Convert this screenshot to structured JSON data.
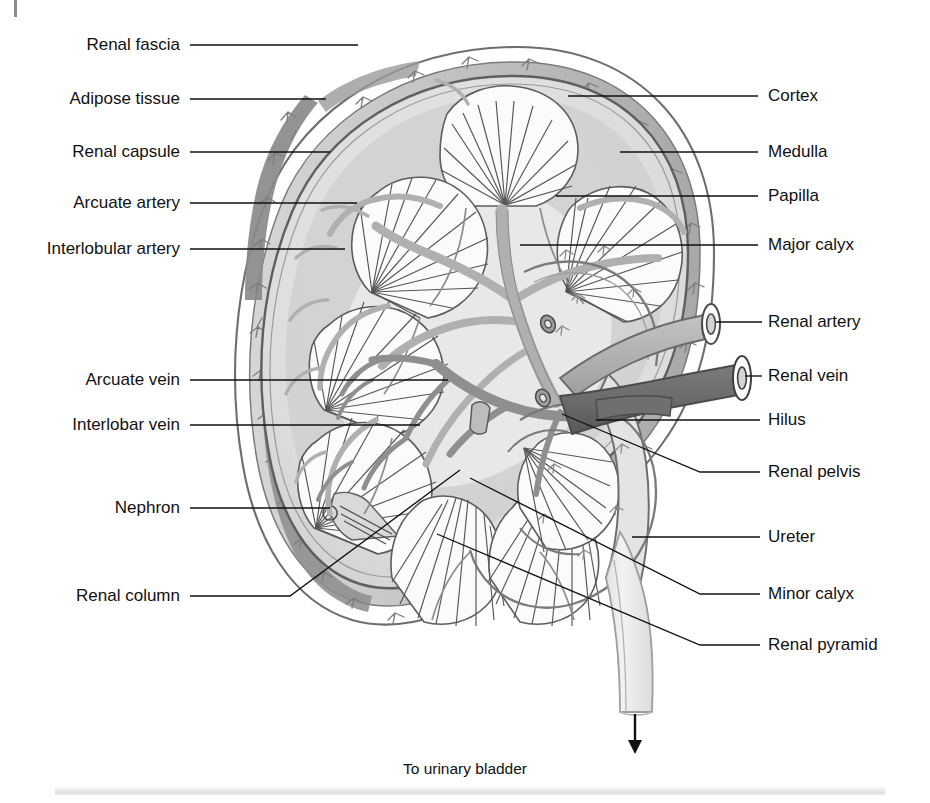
{
  "figure": {
    "caption_below": "To urinary  bladder",
    "arrow_icon": "down-arrow-icon",
    "colors": {
      "ink": "#3f3f3f",
      "line": "#1a1a1a",
      "fascia_fill": "#ffffff",
      "adipose_fill": "#c9c9c9",
      "adipose_dark": "#8e8e8e",
      "capsule_stroke": "#6e6e6e",
      "cortex_fill": "#dedede",
      "medulla_fill": "#cfcfcf",
      "pyramid_fill": "#fbfbfb",
      "pelvis_fill": "#ededed",
      "artery_fill": "#b3b3b3",
      "vein_fill": "#6f6f6f",
      "vein_dark": "#585858",
      "ureter_fill": "#ececec"
    }
  },
  "labels_left": [
    {
      "id": "renal-fascia",
      "text": "Renal fascia",
      "y": 45,
      "text_x": 180,
      "line_x1": 190,
      "line_x2": 358,
      "tip_x": 358,
      "tip_y": 45
    },
    {
      "id": "adipose-tissue",
      "text": "Adipose tissue",
      "y": 99,
      "text_x": 180,
      "line_x1": 190,
      "line_x2": 326,
      "tip_x": 326,
      "tip_y": 99
    },
    {
      "id": "renal-capsule",
      "text": "Renal capsule",
      "y": 152,
      "text_x": 180,
      "line_x1": 190,
      "line_x2": 330,
      "tip_x": 330,
      "tip_y": 152
    },
    {
      "id": "arcuate-artery",
      "text": "Arcuate artery",
      "y": 203,
      "text_x": 180,
      "line_x1": 190,
      "line_x2": 357,
      "tip_x": 357,
      "tip_y": 203
    },
    {
      "id": "interlobular-artery",
      "text": "Interlobular artery",
      "y": 249,
      "text_x": 180,
      "line_x1": 190,
      "line_x2": 345,
      "tip_x": 345,
      "tip_y": 249
    },
    {
      "id": "arcuate-vein",
      "text": "Arcuate vein",
      "y": 380,
      "text_x": 180,
      "line_x1": 190,
      "line_x2": 448,
      "tip_x": 448,
      "tip_y": 380
    },
    {
      "id": "interlobar-vein",
      "text": "Interlobar vein",
      "y": 425,
      "text_x": 180,
      "line_x1": 190,
      "line_x2": 420,
      "tip_x": 420,
      "tip_y": 425
    },
    {
      "id": "nephron",
      "text": "Nephron",
      "y": 508,
      "text_x": 180,
      "line_x1": 190,
      "line_x2": 330,
      "tip_x": 330,
      "tip_y": 508
    },
    {
      "id": "renal-column",
      "text": "Renal column",
      "y": 596,
      "text_x": 180,
      "line_x1": 190,
      "line_x2": 290,
      "tip_x": 460,
      "tip_y": 470
    }
  ],
  "labels_right": [
    {
      "id": "cortex",
      "text": "Cortex",
      "y": 96,
      "text_x": 768,
      "line_x1": 700,
      "line_x2": 758,
      "tip_x": 568,
      "tip_y": 96
    },
    {
      "id": "medulla",
      "text": "Medulla",
      "y": 152,
      "text_x": 768,
      "line_x1": 700,
      "line_x2": 758,
      "tip_x": 620,
      "tip_y": 152
    },
    {
      "id": "papilla",
      "text": "Papilla",
      "y": 196,
      "text_x": 768,
      "line_x1": 700,
      "line_x2": 758,
      "tip_x": 556,
      "tip_y": 196
    },
    {
      "id": "major-calyx",
      "text": "Major calyx",
      "y": 245,
      "text_x": 768,
      "line_x1": 700,
      "line_x2": 758,
      "tip_x": 520,
      "tip_y": 245
    },
    {
      "id": "renal-artery",
      "text": "Renal artery",
      "y": 322,
      "text_x": 768,
      "line_x1": 716,
      "line_x2": 762,
      "tip_x": 716,
      "tip_y": 322
    },
    {
      "id": "renal-vein",
      "text": "Renal vein",
      "y": 376,
      "text_x": 768,
      "line_x1": 745,
      "line_x2": 762,
      "tip_x": 745,
      "tip_y": 376
    },
    {
      "id": "hilus",
      "text": "Hilus",
      "y": 420,
      "text_x": 768,
      "line_x1": 700,
      "line_x2": 760,
      "tip_x": 596,
      "tip_y": 420
    },
    {
      "id": "renal-pelvis",
      "text": "Renal pelvis",
      "y": 472,
      "text_x": 768,
      "line_x1": 700,
      "line_x2": 760,
      "tip_x": 562,
      "tip_y": 414
    },
    {
      "id": "ureter",
      "text": "Ureter",
      "y": 537,
      "text_x": 768,
      "line_x1": 632,
      "line_x2": 760,
      "tip_x": 632,
      "tip_y": 537
    },
    {
      "id": "minor-calyx",
      "text": "Minor calyx",
      "y": 594,
      "text_x": 768,
      "line_x1": 700,
      "line_x2": 760,
      "tip_x": 470,
      "tip_y": 478
    },
    {
      "id": "renal-pyramid",
      "text": "Renal pyramid",
      "y": 645,
      "text_x": 768,
      "line_x1": 700,
      "line_x2": 760,
      "tip_x": 437,
      "tip_y": 534
    }
  ]
}
